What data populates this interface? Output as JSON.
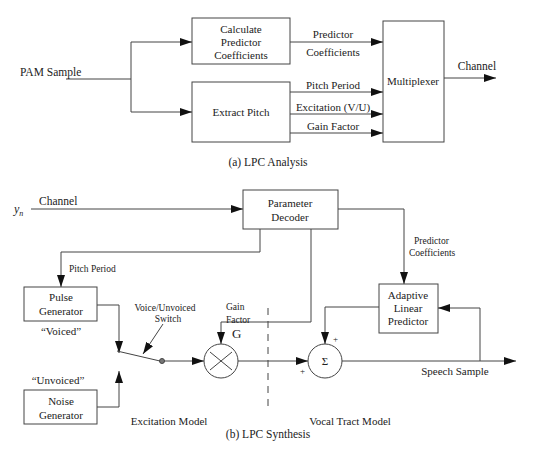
{
  "analysis": {
    "caption": "(a) LPC Analysis",
    "input_label": "PAM Sample",
    "blocks": {
      "calc_predictor": [
        "Calculate",
        "Predictor",
        "Coefficients"
      ],
      "extract_pitch": "Extract Pitch",
      "multiplexer": "Multiplexer"
    },
    "signals": {
      "predictor": "Predictor",
      "coefficients": "Coefficients",
      "pitch_period": "Pitch Period",
      "excitation": "Excitation (V/U)",
      "gain_factor": "Gain Factor",
      "output": "Channel"
    }
  },
  "synthesis": {
    "caption": "(b) LPC Synthesis",
    "input_symbol": "y",
    "input_subscript": "n",
    "input_label": "Channel",
    "blocks": {
      "decoder": [
        "Parameter",
        "Decoder"
      ],
      "pulse": [
        "Pulse",
        "Generator"
      ],
      "noise": [
        "Noise",
        "Generator"
      ],
      "predictor": [
        "Adaptive",
        "Linear",
        "Predictor"
      ]
    },
    "signals": {
      "pitch_period": "Pitch Period",
      "predictor_coeffs": [
        "Predictor",
        "Coefficients"
      ],
      "gain": [
        "Gain",
        "Factor",
        "G"
      ],
      "switch": [
        "Voice/Unvoiced",
        "Switch"
      ],
      "voiced": "“Voiced”",
      "unvoiced": "“Unvoiced”",
      "output": "Speech Sample",
      "plus": "+",
      "sigma": "Σ"
    },
    "regions": {
      "excitation": "Excitation Model",
      "vocal_tract": "Vocal Tract Model"
    }
  }
}
